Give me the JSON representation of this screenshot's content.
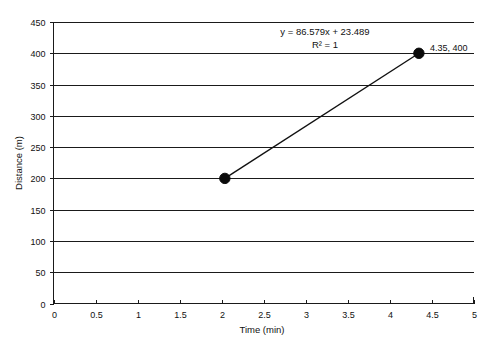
{
  "chart_data": {
    "type": "scatter",
    "title": "",
    "xlabel": "Time (min)",
    "ylabel": "Distance (m)",
    "xlim": [
      0,
      5
    ],
    "ylim": [
      0,
      450
    ],
    "grid": "horizontal",
    "legend": "none",
    "x": [
      2.04,
      4.35
    ],
    "y": [
      200,
      400
    ],
    "series": [
      {
        "name": "Distance vs Time",
        "points": [
          {
            "x": 2.04,
            "y": 200
          },
          {
            "x": 4.35,
            "y": 400
          }
        ]
      }
    ],
    "xticks": [
      0,
      0.5,
      1,
      1.5,
      2,
      2.5,
      3,
      3.5,
      4,
      4.5,
      5
    ],
    "xtick_labels": [
      "0",
      "0.5",
      "1",
      "1.5",
      "2",
      "2.5",
      "3",
      "3.5",
      "4",
      "4.5",
      "5"
    ],
    "yticks": [
      0,
      50,
      100,
      150,
      200,
      250,
      300,
      350,
      400,
      450
    ],
    "ytick_labels": [
      "0",
      "50",
      "100",
      "150",
      "200",
      "250",
      "300",
      "350",
      "400",
      "450"
    ],
    "annotations": [
      {
        "name": "trendline-equation",
        "text": "y = 86.579x + 23.489"
      },
      {
        "name": "r-squared",
        "text": "R² = 1"
      },
      {
        "name": "data-point-label",
        "text": "4.35, 400"
      }
    ],
    "colors": {
      "line": "#111111",
      "marker": "#0a0a0a",
      "grid": "#1a1a1a",
      "axis": "#1a1a1a",
      "background": "#ffffff"
    }
  }
}
